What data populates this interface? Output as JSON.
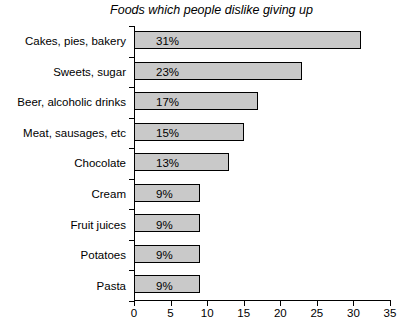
{
  "chart_data": {
    "type": "bar",
    "orientation": "horizontal",
    "title": "Foods which people dislike giving up",
    "xlabel": "",
    "ylabel": "",
    "xlim": [
      0,
      35
    ],
    "xticks": [
      "0",
      "5",
      "10",
      "15",
      "20",
      "25",
      "30",
      "35"
    ],
    "grid": false,
    "legend": false,
    "bar_fill_color": "#c9c9c9",
    "bar_border_color": "#000000",
    "background_color": "#ffffff",
    "categories": [
      "Cakes, pies, bakery",
      "Sweets, sugar",
      "Beer, alcoholic drinks",
      "Meat, sausages, etc",
      "Chocolate",
      "Cream",
      "Fruit juices",
      "Potatoes",
      "Pasta"
    ],
    "values": [
      31,
      23,
      17,
      15,
      13,
      9,
      9,
      9,
      9
    ],
    "value_labels": [
      "31%",
      "23%",
      "17%",
      "15%",
      "13%",
      "9%",
      "9%",
      "9%",
      "9%"
    ]
  }
}
